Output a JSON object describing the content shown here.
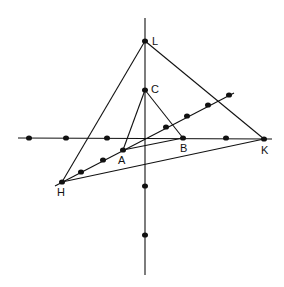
{
  "diagram": {
    "background": "#ffffff",
    "stroke": "#111111",
    "points": {
      "L": {
        "label": "L",
        "x": 145,
        "y": 41,
        "lx": 152,
        "ly": 45
      },
      "C": {
        "label": "C",
        "x": 145,
        "y": 90,
        "lx": 151,
        "ly": 93
      },
      "A": {
        "label": "A",
        "x": 123,
        "y": 150,
        "lx": 118,
        "ly": 164
      },
      "B": {
        "label": "B",
        "x": 183,
        "y": 138,
        "lx": 180,
        "ly": 152
      },
      "K": {
        "label": "K",
        "x": 264,
        "y": 139,
        "lx": 261,
        "ly": 154
      },
      "H": {
        "label": "H",
        "x": 62,
        "y": 182,
        "lx": 57,
        "ly": 196
      }
    },
    "axes": {
      "horizontal": {
        "x1": 18,
        "y1": 138,
        "x2": 272,
        "y2": 139
      },
      "vertical": {
        "x1": 145,
        "y1": 18,
        "x2": 145,
        "y2": 275
      }
    },
    "diagonal": {
      "x1": 55,
      "y1": 186,
      "x2": 234,
      "y2": 93
    },
    "horizontal_dots": [
      [
        29,
        138
      ],
      [
        66,
        138
      ],
      [
        107,
        138
      ],
      [
        183,
        138
      ],
      [
        226,
        138
      ],
      [
        264,
        139
      ]
    ],
    "diagonal_dots": [
      [
        62,
        182
      ],
      [
        81,
        172
      ],
      [
        103,
        160
      ],
      [
        123,
        150
      ],
      [
        166,
        127
      ],
      [
        187,
        116
      ],
      [
        208,
        105
      ],
      [
        229,
        95
      ]
    ],
    "vertical_dots": [
      [
        145,
        41
      ],
      [
        145,
        90
      ],
      [
        145,
        186
      ],
      [
        145,
        235
      ]
    ]
  }
}
